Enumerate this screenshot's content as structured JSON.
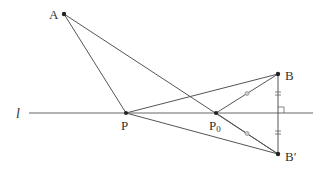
{
  "diagram": {
    "colors": {
      "stroke": "#555555",
      "point": "#222222",
      "text": "#333333",
      "mark": "#888888"
    },
    "line": {
      "label": "l",
      "x1": 29,
      "x2": 313,
      "y": 113
    },
    "points": {
      "A": {
        "label": "A",
        "x": 64,
        "y": 14
      },
      "B": {
        "label": "B",
        "x": 278,
        "y": 74
      },
      "Bp": {
        "label": "B′",
        "x": 278,
        "y": 154
      },
      "P": {
        "label": "P",
        "x": 126,
        "y": 113
      },
      "P0": {
        "label": "P",
        "sub": "0",
        "x": 216,
        "y": 113
      }
    },
    "segments": [
      "A-P",
      "A-Bp",
      "P-B",
      "P-Bp",
      "P0-B",
      "P0-Bp",
      "B-Bp"
    ],
    "marks": {
      "equal_ticks_on_BBp": 2,
      "equal_circles_on_P0B_P0Bp": 2,
      "right_angle_at": "intersection of BB′ and l"
    }
  }
}
